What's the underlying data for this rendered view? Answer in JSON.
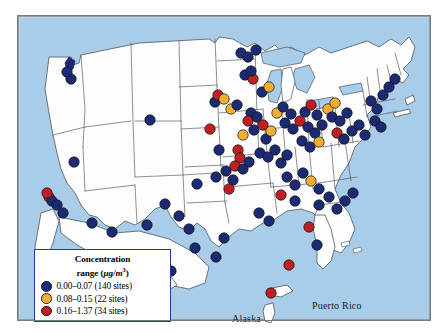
{
  "figure": {
    "type": "choropleth-point-map",
    "region": "United States including Alaska, Hawaii and Puerto Rico",
    "background_color": "#a9cde9",
    "land_color": "#fdfdfd",
    "border_color": "#8d9aa6"
  },
  "legend": {
    "title_line1": "Concentration",
    "title_line2_prefix": "range (",
    "title_units": "μg/m",
    "title_units_exp": "3",
    "title_line2_suffix": ")",
    "border_color": "#2b3a8c",
    "items": [
      {
        "label": "0.00–0.07 (140 sites)",
        "range_min": 0.0,
        "range_max": 0.07,
        "sites": 140,
        "color": "#1b2a72"
      },
      {
        "label": "0.08–0.15 (22 sites)",
        "range_min": 0.08,
        "range_max": 0.15,
        "sites": 22,
        "color": "#f2ae32"
      },
      {
        "label": "0.16–1.37 (34 sites)",
        "range_min": 0.16,
        "range_max": 1.37,
        "sites": 34,
        "color": "#bf1f23"
      }
    ]
  },
  "map_labels": {
    "hawaii": "Hawaii",
    "alaska": "Alaska",
    "puerto_rico": "Puerto Rico"
  },
  "chart_data": {
    "type": "scatter",
    "title": "Concentration range (μg/m3)",
    "total_sites": 196,
    "categories": [
      "0.00–0.07",
      "0.08–0.15",
      "0.16–1.37"
    ],
    "values": [
      140,
      22,
      34
    ],
    "colors": [
      "#1b2a72",
      "#f2ae32",
      "#bf1f23"
    ],
    "points": [
      {
        "x": 55,
        "y": 145,
        "c": 0
      },
      {
        "x": 52,
        "y": 62,
        "c": 0
      },
      {
        "x": 48,
        "y": 55,
        "c": 0
      },
      {
        "x": 30,
        "y": 180,
        "c": 2
      },
      {
        "x": 33,
        "y": 184,
        "c": 0
      },
      {
        "x": 38,
        "y": 188,
        "c": 0
      },
      {
        "x": 28,
        "y": 176,
        "c": 2
      },
      {
        "x": 44,
        "y": 196,
        "c": 0
      },
      {
        "x": 73,
        "y": 206,
        "c": 0
      },
      {
        "x": 93,
        "y": 215,
        "c": 0
      },
      {
        "x": 128,
        "y": 208,
        "c": 0
      },
      {
        "x": 131,
        "y": 103,
        "c": 0
      },
      {
        "x": 146,
        "y": 187,
        "c": 0
      },
      {
        "x": 196,
        "y": 85,
        "c": 0
      },
      {
        "x": 199,
        "y": 78,
        "c": 2
      },
      {
        "x": 205,
        "y": 82,
        "c": 1
      },
      {
        "x": 191,
        "y": 112,
        "c": 2
      },
      {
        "x": 200,
        "y": 133,
        "c": 0
      },
      {
        "x": 178,
        "y": 167,
        "c": 0
      },
      {
        "x": 197,
        "y": 160,
        "c": 0
      },
      {
        "x": 207,
        "y": 154,
        "c": 0
      },
      {
        "x": 214,
        "y": 163,
        "c": 0
      },
      {
        "x": 210,
        "y": 172,
        "c": 2
      },
      {
        "x": 160,
        "y": 199,
        "c": 0
      },
      {
        "x": 170,
        "y": 212,
        "c": 0
      },
      {
        "x": 176,
        "y": 231,
        "c": 0
      },
      {
        "x": 197,
        "y": 240,
        "c": 0
      },
      {
        "x": 205,
        "y": 221,
        "c": 0
      },
      {
        "x": 222,
        "y": 36,
        "c": 0
      },
      {
        "x": 229,
        "y": 40,
        "c": 0
      },
      {
        "x": 237,
        "y": 33,
        "c": 0
      },
      {
        "x": 226,
        "y": 58,
        "c": 0
      },
      {
        "x": 234,
        "y": 62,
        "c": 2
      },
      {
        "x": 232,
        "y": 54,
        "c": 0
      },
      {
        "x": 243,
        "y": 75,
        "c": 0
      },
      {
        "x": 250,
        "y": 70,
        "c": 1
      },
      {
        "x": 212,
        "y": 92,
        "c": 1
      },
      {
        "x": 218,
        "y": 88,
        "c": 0
      },
      {
        "x": 232,
        "y": 96,
        "c": 0
      },
      {
        "x": 229,
        "y": 104,
        "c": 2
      },
      {
        "x": 238,
        "y": 100,
        "c": 0
      },
      {
        "x": 224,
        "y": 118,
        "c": 1
      },
      {
        "x": 235,
        "y": 113,
        "c": 0
      },
      {
        "x": 244,
        "y": 108,
        "c": 2
      },
      {
        "x": 247,
        "y": 122,
        "c": 0
      },
      {
        "x": 252,
        "y": 114,
        "c": 1
      },
      {
        "x": 219,
        "y": 133,
        "c": 2
      },
      {
        "x": 221,
        "y": 141,
        "c": 2
      },
      {
        "x": 216,
        "y": 149,
        "c": 2
      },
      {
        "x": 224,
        "y": 152,
        "c": 0
      },
      {
        "x": 230,
        "y": 145,
        "c": 0
      },
      {
        "x": 241,
        "y": 136,
        "c": 0
      },
      {
        "x": 249,
        "y": 140,
        "c": 0
      },
      {
        "x": 256,
        "y": 133,
        "c": 0
      },
      {
        "x": 262,
        "y": 146,
        "c": 0
      },
      {
        "x": 268,
        "y": 138,
        "c": 0
      },
      {
        "x": 258,
        "y": 96,
        "c": 1
      },
      {
        "x": 264,
        "y": 90,
        "c": 0
      },
      {
        "x": 272,
        "y": 97,
        "c": 0
      },
      {
        "x": 266,
        "y": 106,
        "c": 0
      },
      {
        "x": 274,
        "y": 112,
        "c": 0
      },
      {
        "x": 281,
        "y": 104,
        "c": 2
      },
      {
        "x": 286,
        "y": 95,
        "c": 0
      },
      {
        "x": 292,
        "y": 88,
        "c": 2
      },
      {
        "x": 298,
        "y": 98,
        "c": 0
      },
      {
        "x": 289,
        "y": 110,
        "c": 0
      },
      {
        "x": 296,
        "y": 116,
        "c": 0
      },
      {
        "x": 303,
        "y": 108,
        "c": 0
      },
      {
        "x": 283,
        "y": 124,
        "c": 0
      },
      {
        "x": 291,
        "y": 130,
        "c": 0
      },
      {
        "x": 300,
        "y": 125,
        "c": 1
      },
      {
        "x": 309,
        "y": 92,
        "c": 1
      },
      {
        "x": 316,
        "y": 86,
        "c": 1
      },
      {
        "x": 313,
        "y": 100,
        "c": 0
      },
      {
        "x": 321,
        "y": 104,
        "c": 0
      },
      {
        "x": 328,
        "y": 96,
        "c": 0
      },
      {
        "x": 318,
        "y": 116,
        "c": 2
      },
      {
        "x": 325,
        "y": 122,
        "c": 0
      },
      {
        "x": 333,
        "y": 114,
        "c": 0
      },
      {
        "x": 340,
        "y": 108,
        "c": 0
      },
      {
        "x": 346,
        "y": 118,
        "c": 0
      },
      {
        "x": 352,
        "y": 84,
        "c": 0
      },
      {
        "x": 358,
        "y": 92,
        "c": 0
      },
      {
        "x": 364,
        "y": 78,
        "c": 0
      },
      {
        "x": 356,
        "y": 104,
        "c": 0
      },
      {
        "x": 362,
        "y": 110,
        "c": 0
      },
      {
        "x": 370,
        "y": 70,
        "c": 0
      },
      {
        "x": 376,
        "y": 62,
        "c": 0
      },
      {
        "x": 268,
        "y": 160,
        "c": 0
      },
      {
        "x": 276,
        "y": 168,
        "c": 0
      },
      {
        "x": 284,
        "y": 156,
        "c": 0
      },
      {
        "x": 292,
        "y": 164,
        "c": 1
      },
      {
        "x": 300,
        "y": 172,
        "c": 0
      },
      {
        "x": 262,
        "y": 178,
        "c": 2
      },
      {
        "x": 276,
        "y": 184,
        "c": 0
      },
      {
        "x": 300,
        "y": 188,
        "c": 0
      },
      {
        "x": 310,
        "y": 180,
        "c": 0
      },
      {
        "x": 318,
        "y": 192,
        "c": 0
      },
      {
        "x": 326,
        "y": 184,
        "c": 0
      },
      {
        "x": 334,
        "y": 176,
        "c": 0
      },
      {
        "x": 240,
        "y": 196,
        "c": 0
      },
      {
        "x": 250,
        "y": 204,
        "c": 0
      },
      {
        "x": 290,
        "y": 210,
        "c": 2
      },
      {
        "x": 298,
        "y": 228,
        "c": 0
      },
      {
        "x": 152,
        "y": 254,
        "c": 0
      },
      {
        "x": 270,
        "y": 248,
        "c": 2
      },
      {
        "x": 252,
        "y": 276,
        "c": 2
      }
    ]
  }
}
